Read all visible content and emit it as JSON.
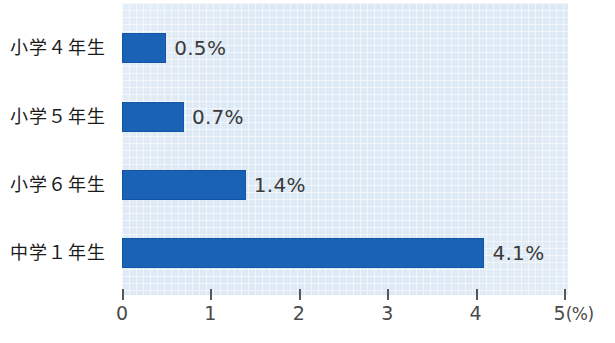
{
  "chart_data": {
    "type": "bar",
    "orientation": "horizontal",
    "title": "",
    "subtitle": "",
    "xlabel": "(%)",
    "ylabel": "",
    "categories": [
      "小学４年生",
      "小学５年生",
      "小学６年生",
      "中学１年生"
    ],
    "values": [
      0.5,
      0.7,
      1.4,
      4.1
    ],
    "value_labels": [
      "0.5%",
      "0.7%",
      "1.4%",
      "4.1%"
    ],
    "xlim": [
      0,
      5
    ],
    "xticks": [
      0,
      1,
      2,
      3,
      4,
      5
    ],
    "xtick_labels": [
      "0",
      "1",
      "2",
      "3",
      "4",
      "5"
    ],
    "xtick_unit_suffix": "(%)",
    "grid": true,
    "legend": null,
    "annotations": [],
    "series": [
      {
        "name": "",
        "values": [
          0.5,
          0.7,
          1.4,
          4.1
        ],
        "color": "#1a62b5"
      }
    ]
  },
  "style": {
    "bar_color": "#1a62b5",
    "plot_background": "#dde9f5",
    "page_background": "#ffffff",
    "label_color": "#1b1b1b",
    "value_color": "#3a3a3a",
    "tick_color": "#4a4a4a"
  }
}
